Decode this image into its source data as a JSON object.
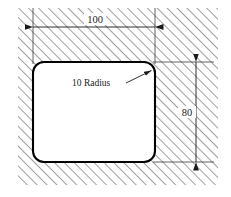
{
  "drawing": {
    "type": "engineering-section-drawing",
    "canvas": {
      "width": 231,
      "height": 197,
      "background": "#ffffff"
    },
    "hatch_region": {
      "label": "section-hatching",
      "x": 18,
      "y": 8,
      "width": 200,
      "height": 177,
      "angle_deg": 45,
      "spacing_px": 7,
      "line_color": "#2b2b2b",
      "line_width": 0.9
    },
    "cutout": {
      "label": "rounded-rectangle-cutout",
      "x": 33,
      "y": 62,
      "width": 122,
      "height": 100,
      "corner_radius": 11,
      "fill": "#ffffff",
      "stroke": "#000000",
      "stroke_width": 2.1
    },
    "dimensions": [
      {
        "name": "width-dimension",
        "value": "100",
        "orientation": "horizontal",
        "line_y": 27,
        "from_x": 33,
        "to_x": 155,
        "text_x": 94,
        "text_y": 23,
        "arrows": "both",
        "color": "#1a1a1a"
      },
      {
        "name": "height-dimension",
        "value": "80",
        "orientation": "vertical",
        "line_x": 196,
        "from_y": 62,
        "to_y": 162,
        "text_x": 190,
        "text_y": 115,
        "arrows": "both",
        "color": "#1a1a1a"
      }
    ],
    "extension_lines": [
      {
        "name": "left-extension-line",
        "x1": 33,
        "y1": 8,
        "x2": 33,
        "y2": 62
      },
      {
        "name": "right-extension-line",
        "x1": 155,
        "y1": 8,
        "x2": 155,
        "y2": 62
      },
      {
        "name": "top-extension-line",
        "x1": 155,
        "y1": 62,
        "x2": 214,
        "y2": 62
      },
      {
        "name": "bottom-extension-line",
        "x1": 155,
        "y1": 162,
        "x2": 214,
        "y2": 162
      }
    ],
    "annotations": [
      {
        "name": "radius-callout",
        "text": "10 Radius",
        "text_x": 72,
        "text_y": 86,
        "leader": {
          "x1": 126,
          "y1": 83,
          "x2": 152,
          "y2": 70
        },
        "arrow_at": "end",
        "points_to": "top-right-corner-arc",
        "color": "#1a1a1a"
      }
    ],
    "colors": {
      "outline": "#000000",
      "hatch": "#2b2b2b",
      "dimension": "#1a1a1a",
      "background": "#ffffff",
      "cutout_fill": "#ffffff"
    }
  }
}
